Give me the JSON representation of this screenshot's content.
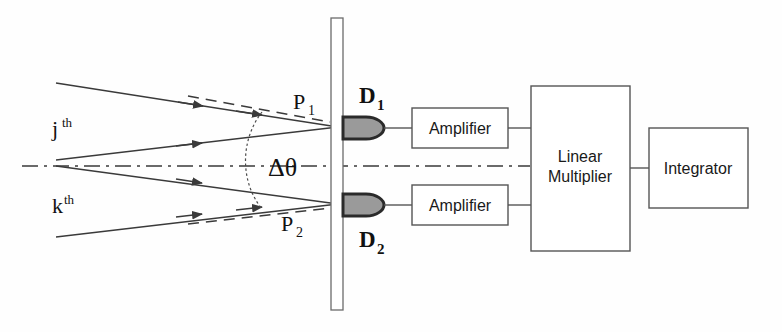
{
  "figure": {
    "background_color": "#fefefe",
    "ink_color": "#2b2b2b",
    "detector_fill": "#9a9a9a",
    "detector_stroke": "#2a2a2a",
    "box_stroke": "#555555"
  },
  "source_labels": {
    "j_base": "j",
    "j_sup": "th",
    "k_base": "k",
    "k_sup": "th"
  },
  "angle": {
    "symbol": "Δθ"
  },
  "pinholes": [
    {
      "base": "P",
      "sub": "1"
    },
    {
      "base": "P",
      "sub": "2"
    }
  ],
  "detectors": [
    {
      "base": "D",
      "sub": "1"
    },
    {
      "base": "D",
      "sub": "2"
    }
  ],
  "blocks": [
    {
      "label": "Amplifier"
    },
    {
      "label": "Amplifier"
    },
    {
      "label_line1": "Linear",
      "label_line2": "Multiplier"
    },
    {
      "label": "Integrator"
    }
  ],
  "amplifier_top": {
    "label": "Amplifier"
  },
  "amplifier_bottom": {
    "label": "Amplifier"
  },
  "multiplier": {
    "line1": "Linear",
    "line2": "Multiplier"
  },
  "integrator": {
    "label": "Integrator"
  }
}
